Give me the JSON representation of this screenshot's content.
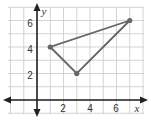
{
  "chart_data": {
    "type": "scatter",
    "title": "",
    "xlabel": "x",
    "ylabel": "y",
    "xlim": [
      -2,
      8
    ],
    "ylim": [
      -1,
      7
    ],
    "grid": true,
    "x_tick_labels": [
      "2",
      "4",
      "6"
    ],
    "y_tick_labels": [
      "2",
      "4",
      "6"
    ],
    "series": [
      {
        "name": "triangle",
        "points": [
          [
            1,
            4
          ],
          [
            3,
            2
          ],
          [
            7,
            6
          ]
        ],
        "closed": true,
        "color": "#666666"
      }
    ]
  },
  "colors": {
    "grid": "#c8c8c8",
    "axis": "#222222",
    "shape": "#666666"
  }
}
